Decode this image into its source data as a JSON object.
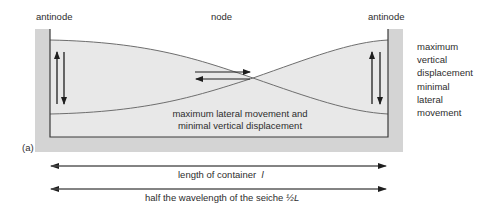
{
  "figure": {
    "panel_label": "(a)",
    "labels": {
      "antinode_left": "antinode",
      "node": "node",
      "antinode_right": "antinode"
    },
    "right_annotation": [
      "maximum",
      "vertical",
      "displacement",
      "minimal",
      "lateral",
      "movement"
    ],
    "center_annotation": {
      "line1": "maximum lateral movement and",
      "line2": "minimal vertical displacement"
    },
    "dimension_lines": [
      {
        "text": "length of container",
        "symbol": "l"
      },
      {
        "text": "half the wavelength of the seiche",
        "symbol": "½L"
      }
    ],
    "colors": {
      "wall": "#cfcfcf",
      "water": "#e6e6e6",
      "outline": "#3a3a3a",
      "curve": "#6e6e6e",
      "arrow": "#1e1e1e"
    }
  }
}
